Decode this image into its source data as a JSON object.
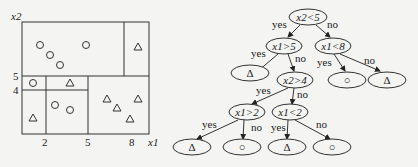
{
  "partition_plot": {
    "x_axis_label": "x1",
    "y_axis_label": "x2",
    "x_ticks": [
      "2",
      "5",
      "8"
    ],
    "y_ticks": [
      "4",
      "5"
    ],
    "circle_symbol": "○",
    "triangle_symbol": "△"
  },
  "decision_tree": {
    "nodes": {
      "root": "x2<5",
      "n_x1_gt_5": "x1>5",
      "n_x1_lt_8": "x1<8",
      "n_x2_gt_4": "x2>4",
      "n_x1_gt_2": "x1>2",
      "n_x1_lt_2": "x1<2"
    },
    "leaves": {
      "l1": "Δ",
      "l2": "○",
      "l3": "Δ",
      "l4": "Δ",
      "l5": "○",
      "l6": "Δ",
      "l7": "○"
    },
    "edge_labels": {
      "yes": "yes",
      "no": "no"
    }
  }
}
